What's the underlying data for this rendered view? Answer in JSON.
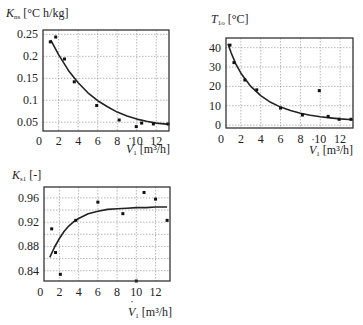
{
  "chart_data": [
    {
      "type": "scatter",
      "title": "",
      "ylabel_symbol": "K",
      "ylabel_sub": "ns",
      "ylabel_unit": "[°C h/kg]",
      "xlabel_symbol": "V",
      "xlabel_sub": "1",
      "xlabel_unit": "[m³/h]",
      "xlim": [
        0.4,
        13.3
      ],
      "ylim": [
        0.03,
        0.26
      ],
      "xticks": [
        0,
        2,
        4,
        6,
        8,
        10,
        12
      ],
      "yticks": [
        0.05,
        0.1,
        0.15,
        0.2,
        0.25
      ],
      "ytick_labels": [
        "0.05",
        "0.1",
        "0.15",
        "0.2",
        "0.25"
      ],
      "grid": true,
      "series": [
        {
          "name": "measured",
          "x": [
            1.15,
            1.7,
            2.6,
            3.6,
            5.9,
            8.2,
            9.95,
            10.5,
            11.7,
            13.2
          ],
          "y": [
            0.233,
            0.244,
            0.194,
            0.142,
            0.088,
            0.055,
            0.04,
            0.048,
            0.046,
            0.046
          ]
        },
        {
          "name": "fit",
          "kind": "line",
          "x": [
            1.2,
            2,
            3,
            4,
            5,
            6,
            7,
            8,
            9,
            10,
            11,
            12,
            13.3
          ],
          "y": [
            0.237,
            0.204,
            0.168,
            0.14,
            0.117,
            0.099,
            0.085,
            0.073,
            0.064,
            0.057,
            0.052,
            0.048,
            0.045
          ]
        }
      ]
    },
    {
      "type": "scatter",
      "title": "",
      "ylabel_symbol": "T",
      "ylabel_sub": "1o",
      "ylabel_unit": "[°C]",
      "xlabel_symbol": "V",
      "xlabel_sub": "1",
      "xlabel_unit": "[m³/h]",
      "xlim": [
        0.5,
        13.3
      ],
      "ylim": [
        -1.5,
        45
      ],
      "xticks": [
        0,
        2,
        4,
        6,
        8,
        10,
        12
      ],
      "yticks": [
        0,
        10,
        20,
        30,
        40
      ],
      "ytick_labels": [
        "0",
        "10",
        "20",
        "30",
        "40"
      ],
      "grid": true,
      "series": [
        {
          "name": "measured",
          "x": [
            0.9,
            1.3,
            2.4,
            3.6,
            6.0,
            8.2,
            9.9,
            10.8,
            11.9,
            13.1
          ],
          "y": [
            41.3,
            32.3,
            23.3,
            18.2,
            8.8,
            5.2,
            17.8,
            4.5,
            3.0,
            3.0
          ]
        },
        {
          "name": "fit",
          "kind": "line",
          "x": [
            0.7,
            1,
            1.5,
            2,
            3,
            4,
            5,
            6,
            7,
            8,
            9,
            10,
            11,
            12,
            13.3
          ],
          "y": [
            42,
            37.5,
            31.5,
            26.8,
            20,
            15.2,
            11.8,
            9.3,
            7.5,
            6.1,
            5.1,
            4.3,
            3.7,
            3.2,
            2.8
          ]
        }
      ]
    },
    {
      "type": "scatter",
      "title": "",
      "ylabel_symbol": "K",
      "ylabel_sub": "s1",
      "ylabel_unit": "[-]",
      "xlabel_symbol": "V",
      "xlabel_sub": "1",
      "xlabel_unit": "[m³/h]",
      "xlim": [
        0.4,
        13.5
      ],
      "ylim": [
        0.823,
        0.978
      ],
      "xticks": [
        0,
        2,
        4,
        6,
        8,
        10,
        12
      ],
      "yticks": [
        0.84,
        0.88,
        0.92,
        0.96
      ],
      "ytick_labels": [
        "0.84",
        "0.88",
        "0.92",
        "0.96"
      ],
      "minor_ygrid": [
        0.86,
        0.9,
        0.94
      ],
      "grid": true,
      "series": [
        {
          "name": "measured",
          "x": [
            1.2,
            1.6,
            2.1,
            3.7,
            6.0,
            8.6,
            10.0,
            10.8,
            12.0,
            13.2
          ],
          "y": [
            0.909,
            0.87,
            0.834,
            0.923,
            0.953,
            0.934,
            0.823,
            0.969,
            0.958,
            0.923
          ]
        },
        {
          "name": "fit",
          "kind": "line",
          "x": [
            1.0,
            1.5,
            2,
            2.5,
            3,
            3.5,
            4,
            5,
            6,
            7,
            8,
            9,
            10,
            11,
            12,
            13.2
          ],
          "y": [
            0.862,
            0.879,
            0.893,
            0.905,
            0.914,
            0.921,
            0.926,
            0.934,
            0.938,
            0.941,
            0.942,
            0.943,
            0.944,
            0.944,
            0.945,
            0.945
          ]
        }
      ]
    }
  ]
}
